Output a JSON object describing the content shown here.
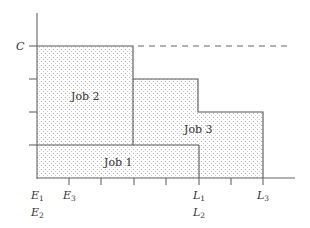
{
  "diagram": {
    "type": "job-scheduling-step-diagram",
    "colors": {
      "line": "#555555",
      "dot": "#b8b8b8",
      "text": "#333333",
      "dashed": "#666666"
    },
    "y_axis": {
      "capacity_label": "C"
    },
    "jobs": [
      {
        "id": "job1",
        "label": "Job 1"
      },
      {
        "id": "job2",
        "label": "Job 2"
      },
      {
        "id": "job3",
        "label": "Job 3"
      }
    ],
    "x_labels": {
      "e1": "E",
      "e1_sub": "1",
      "e2": "E",
      "e2_sub": "2",
      "e3": "E",
      "e3_sub": "3",
      "l1": "L",
      "l1_sub": "1",
      "l2": "L",
      "l2_sub": "2",
      "l3": "L",
      "l3_sub": "3"
    }
  }
}
